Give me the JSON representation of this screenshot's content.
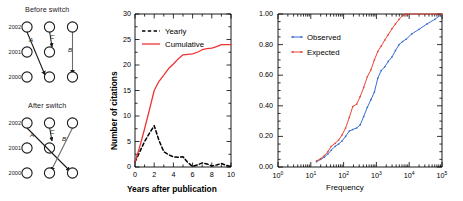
{
  "figure": {
    "background": "#ffffff",
    "panels": [
      "network-switch-diagrams",
      "citation-time-series",
      "frequency-cdf"
    ]
  },
  "diagrams": {
    "before": {
      "title": "Before switch",
      "years": [
        "2002",
        "2001",
        "2000"
      ],
      "edges": [
        {
          "label": "A",
          "from": "2002-left",
          "to": "2000-middle"
        },
        {
          "label": "C",
          "from": "2002-middle",
          "to": "2001-middle"
        },
        {
          "label": "B",
          "from": "2002-right",
          "to": "2000-right"
        }
      ]
    },
    "after": {
      "title": "After switch",
      "years": [
        "2002",
        "2001",
        "2000"
      ],
      "edges": [
        {
          "label": "A",
          "from": "2002-left",
          "to": "2000-right"
        },
        {
          "label": "C",
          "from": "2002-middle",
          "to": "2001-middle"
        },
        {
          "label": "B'",
          "from": "2002-right",
          "to": "2000-middle"
        }
      ]
    }
  },
  "chart_data": [
    {
      "type": "line",
      "id": "citation-time-series",
      "title": "",
      "xlabel": "Years after publication",
      "ylabel": "Number of citations",
      "xlim": [
        0,
        10
      ],
      "ylim": [
        0,
        30
      ],
      "xticks": [
        0,
        2,
        4,
        6,
        8,
        10
      ],
      "xticklabels": [
        "0",
        "2",
        "4",
        "6",
        "8",
        "10"
      ],
      "yticks": [
        0,
        5,
        10,
        15,
        20,
        25,
        30
      ],
      "yticklabels": [
        "0",
        "5",
        "10",
        "15",
        "20",
        "25",
        "30"
      ],
      "grid": false,
      "legend_position": "upper-left",
      "x": [
        0,
        0.5,
        1,
        1.5,
        2,
        2.5,
        3,
        3.5,
        4,
        4.5,
        5,
        5.5,
        6,
        6.5,
        7,
        7.5,
        8,
        8.5,
        9,
        9.5,
        10
      ],
      "series": [
        {
          "name": "Yearly",
          "color": "#000000",
          "style": "dashed",
          "values": [
            1.0,
            3.0,
            5.0,
            6.6,
            8.1,
            5.2,
            3.0,
            2.4,
            2.0,
            1.9,
            2.0,
            0.9,
            0.1,
            0.4,
            0.8,
            0.6,
            0.2,
            0.4,
            0.7,
            0.3,
            0.1
          ]
        },
        {
          "name": "Cumulative",
          "color": "#ee3333",
          "style": "solid",
          "values": [
            1.0,
            4.0,
            7.5,
            11.2,
            15.0,
            16.8,
            18.0,
            19.3,
            20.2,
            21.2,
            22.0,
            22.1,
            22.2,
            22.5,
            23.0,
            23.2,
            23.3,
            23.6,
            24.0,
            24.0,
            24.0
          ]
        }
      ]
    },
    {
      "type": "line",
      "id": "frequency-cdf",
      "title": "",
      "xlabel": "Frequency",
      "ylabel": "",
      "xscale": "log",
      "xlim": [
        1,
        100000
      ],
      "ylim": [
        0.0,
        1.0
      ],
      "xticks": [
        1,
        10,
        100,
        1000,
        10000,
        100000
      ],
      "xticklabels": [
        "10",
        "10",
        "10",
        "10",
        "10",
        "10"
      ],
      "xtickexponents": [
        "0",
        "1",
        "2",
        "3",
        "4",
        "5"
      ],
      "yticks": [
        0.0,
        0.2,
        0.4,
        0.6,
        0.8,
        1.0
      ],
      "yticklabels": [
        "0.00",
        "0.20",
        "0.40",
        "0.60",
        "0.80",
        "1.00"
      ],
      "grid": false,
      "legend_position": "upper-left",
      "series": [
        {
          "name": "Observed",
          "color": "#3b6fd4",
          "style": "dotted-line",
          "x": [
            15,
            20,
            26,
            33,
            42,
            55,
            70,
            90,
            115,
            150,
            190,
            250,
            320,
            410,
            530,
            680,
            870,
            1100,
            1400,
            1800,
            2300,
            3000,
            3800,
            4900,
            6300,
            8000,
            12000,
            20000,
            35000,
            60000,
            100000
          ],
          "values": [
            0.035,
            0.05,
            0.065,
            0.085,
            0.11,
            0.135,
            0.15,
            0.17,
            0.2,
            0.235,
            0.245,
            0.255,
            0.275,
            0.33,
            0.39,
            0.44,
            0.49,
            0.58,
            0.63,
            0.655,
            0.69,
            0.72,
            0.76,
            0.8,
            0.82,
            0.835,
            0.87,
            0.9,
            0.935,
            0.965,
            1.0
          ]
        },
        {
          "name": "Expected",
          "color": "#e8483a",
          "style": "dotted-line",
          "x": [
            15,
            20,
            26,
            33,
            42,
            55,
            70,
            90,
            115,
            150,
            190,
            250,
            320,
            410,
            530,
            680,
            870,
            1100,
            1400,
            1800,
            2300,
            3000,
            3800,
            4900,
            6300,
            8000,
            100000
          ],
          "values": [
            0.04,
            0.055,
            0.075,
            0.1,
            0.135,
            0.155,
            0.175,
            0.21,
            0.255,
            0.325,
            0.395,
            0.41,
            0.46,
            0.52,
            0.59,
            0.635,
            0.7,
            0.755,
            0.79,
            0.83,
            0.865,
            0.905,
            0.935,
            0.965,
            0.99,
            1.0,
            1.0
          ]
        }
      ]
    }
  ]
}
